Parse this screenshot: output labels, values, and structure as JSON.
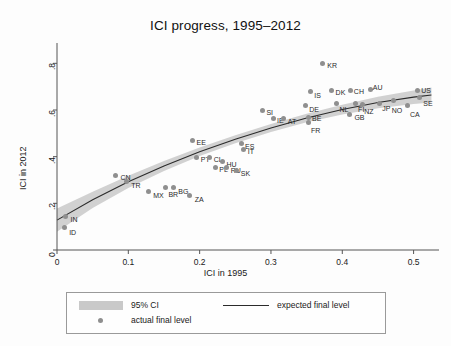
{
  "chart_data": {
    "type": "scatter",
    "title": "ICI progress, 1995–2012",
    "xlabel": "ICI in 1995",
    "ylabel": "ICI in 2012",
    "xlim": [
      0,
      0.53
    ],
    "ylim": [
      0,
      0.87
    ],
    "xticks": [
      "0",
      "0.1",
      "0.2",
      "0.3",
      "0.4",
      "0.5"
    ],
    "xtick_values": [
      0,
      0.1,
      0.2,
      0.3,
      0.4,
      0.5
    ],
    "yticks": [
      "0",
      ".2",
      ".4",
      ".6",
      ".8"
    ],
    "ytick_values": [
      0,
      0.2,
      0.4,
      0.6,
      0.8
    ],
    "grid": false,
    "legend_position": "below-plot",
    "points": [
      {
        "label": "IN",
        "x": 0.012,
        "y": 0.145
      },
      {
        "label": "ID",
        "x": 0.01,
        "y": 0.095
      },
      {
        "label": "CN",
        "x": 0.082,
        "y": 0.32
      },
      {
        "label": "TR",
        "x": 0.097,
        "y": 0.293
      },
      {
        "label": "MX",
        "x": 0.128,
        "y": 0.25
      },
      {
        "label": "BR",
        "x": 0.152,
        "y": 0.27
      },
      {
        "label": "BG",
        "x": 0.163,
        "y": 0.268
      },
      {
        "label": "ZA",
        "x": 0.186,
        "y": 0.232
      },
      {
        "label": "EE",
        "x": 0.19,
        "y": 0.47
      },
      {
        "label": "PT",
        "x": 0.196,
        "y": 0.398
      },
      {
        "label": "CL",
        "x": 0.214,
        "y": 0.398
      },
      {
        "label": "PL",
        "x": 0.222,
        "y": 0.355
      },
      {
        "label": "HU",
        "x": 0.232,
        "y": 0.378
      },
      {
        "label": "RU",
        "x": 0.238,
        "y": 0.352
      },
      {
        "label": "SK",
        "x": 0.252,
        "y": 0.34
      },
      {
        "label": "ES",
        "x": 0.258,
        "y": 0.455
      },
      {
        "label": "IT",
        "x": 0.262,
        "y": 0.432
      },
      {
        "label": "SI",
        "x": 0.288,
        "y": 0.6
      },
      {
        "label": "IE",
        "x": 0.303,
        "y": 0.565
      },
      {
        "label": "AT",
        "x": 0.318,
        "y": 0.562
      },
      {
        "label": "KR",
        "x": 0.372,
        "y": 0.8
      },
      {
        "label": "BE",
        "x": 0.352,
        "y": 0.57
      },
      {
        "label": "FR",
        "x": 0.352,
        "y": 0.548
      },
      {
        "label": "DE",
        "x": 0.348,
        "y": 0.62
      },
      {
        "label": "IS",
        "x": 0.355,
        "y": 0.678
      },
      {
        "label": "DK",
        "x": 0.385,
        "y": 0.682
      },
      {
        "label": "NL",
        "x": 0.392,
        "y": 0.628
      },
      {
        "label": "CH",
        "x": 0.412,
        "y": 0.682
      },
      {
        "label": "FI",
        "x": 0.418,
        "y": 0.628
      },
      {
        "label": "NZ",
        "x": 0.428,
        "y": 0.625
      },
      {
        "label": "AU",
        "x": 0.44,
        "y": 0.69
      },
      {
        "label": "JP",
        "x": 0.452,
        "y": 0.628
      },
      {
        "label": "GB",
        "x": 0.41,
        "y": 0.58
      },
      {
        "label": "NO",
        "x": 0.472,
        "y": 0.64
      },
      {
        "label": "CA",
        "x": 0.492,
        "y": 0.618
      },
      {
        "label": "US",
        "x": 0.505,
        "y": 0.682
      },
      {
        "label": "SE",
        "x": 0.508,
        "y": 0.655
      }
    ],
    "expected_line": [
      {
        "x": 0.0,
        "y": 0.128
      },
      {
        "x": 0.05,
        "y": 0.215
      },
      {
        "x": 0.1,
        "y": 0.292
      },
      {
        "x": 0.15,
        "y": 0.36
      },
      {
        "x": 0.2,
        "y": 0.421
      },
      {
        "x": 0.25,
        "y": 0.475
      },
      {
        "x": 0.3,
        "y": 0.523
      },
      {
        "x": 0.35,
        "y": 0.566
      },
      {
        "x": 0.4,
        "y": 0.602
      },
      {
        "x": 0.45,
        "y": 0.632
      },
      {
        "x": 0.5,
        "y": 0.655
      },
      {
        "x": 0.525,
        "y": 0.664
      }
    ],
    "ci_upper": [
      {
        "x": 0.0,
        "y": 0.178
      },
      {
        "x": 0.05,
        "y": 0.25
      },
      {
        "x": 0.1,
        "y": 0.318
      },
      {
        "x": 0.15,
        "y": 0.381
      },
      {
        "x": 0.2,
        "y": 0.439
      },
      {
        "x": 0.25,
        "y": 0.492
      },
      {
        "x": 0.3,
        "y": 0.54
      },
      {
        "x": 0.35,
        "y": 0.584
      },
      {
        "x": 0.4,
        "y": 0.623
      },
      {
        "x": 0.45,
        "y": 0.657
      },
      {
        "x": 0.5,
        "y": 0.684
      },
      {
        "x": 0.525,
        "y": 0.696
      }
    ],
    "ci_lower": [
      {
        "x": 0.0,
        "y": 0.078
      },
      {
        "x": 0.05,
        "y": 0.18
      },
      {
        "x": 0.1,
        "y": 0.266
      },
      {
        "x": 0.15,
        "y": 0.339
      },
      {
        "x": 0.2,
        "y": 0.403
      },
      {
        "x": 0.25,
        "y": 0.458
      },
      {
        "x": 0.3,
        "y": 0.506
      },
      {
        "x": 0.35,
        "y": 0.548
      },
      {
        "x": 0.4,
        "y": 0.581
      },
      {
        "x": 0.45,
        "y": 0.607
      },
      {
        "x": 0.5,
        "y": 0.626
      },
      {
        "x": 0.525,
        "y": 0.632
      }
    ],
    "colors": {
      "point": "#8f8f8f",
      "line": "#2b2b2b",
      "ci_band": "#c9c9c9",
      "axis": "#555555",
      "background": "#fdfdfd"
    }
  },
  "legend": {
    "ci_label": "95% CI",
    "line_label": "expected final level",
    "point_label": "actual final level"
  }
}
